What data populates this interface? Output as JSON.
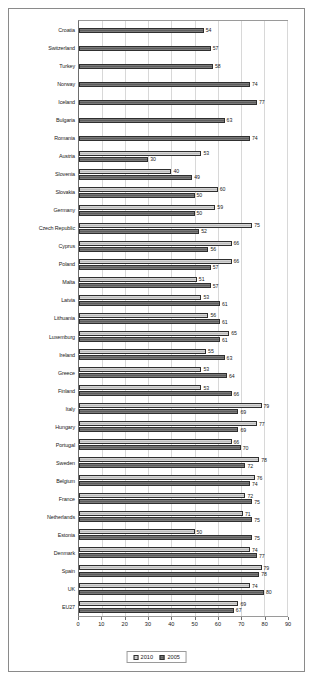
{
  "chart_data": {
    "type": "bar",
    "orientation": "horizontal",
    "title": "",
    "xlabel": "",
    "ylabel": "",
    "xlim": [
      0,
      90
    ],
    "xticks": [
      0,
      10,
      20,
      30,
      40,
      50,
      60,
      70,
      80,
      90
    ],
    "grid": true,
    "legend_position": "bottom",
    "categories": [
      "Croatia",
      "Switzerland",
      "Turkey",
      "Norway",
      "Iceland",
      "Bulgaria",
      "Romania",
      "Austria",
      "Slovenia",
      "Slovakia",
      "Germany",
      "Czech Republic",
      "Cyprus",
      "Poland",
      "Malta",
      "Latvia",
      "Lithuania",
      "Luxemburg",
      "Ireland",
      "Greece",
      "Finland",
      "Italy",
      "Hungary",
      "Portugal",
      "Sweden",
      "Belgium",
      "France",
      "Netherlands",
      "Estonia",
      "Denmark",
      "Spain",
      "UK",
      "EU27"
    ],
    "series": [
      {
        "name": "2010",
        "color": "#c9c9c9",
        "values": [
          null,
          null,
          null,
          null,
          null,
          null,
          null,
          53,
          40,
          60,
          59,
          75,
          66,
          66,
          51,
          53,
          56,
          65,
          55,
          53,
          53,
          79,
          77,
          66,
          78,
          76,
          72,
          71,
          50,
          74,
          79,
          74,
          69
        ]
      },
      {
        "name": "2005",
        "color": "#6b6b6b",
        "values": [
          54,
          57,
          58,
          74,
          77,
          63,
          74,
          30,
          49,
          50,
          50,
          52,
          56,
          57,
          57,
          61,
          61,
          61,
          63,
          64,
          66,
          69,
          69,
          70,
          72,
          74,
          75,
          75,
          75,
          77,
          78,
          80,
          67
        ]
      }
    ]
  }
}
